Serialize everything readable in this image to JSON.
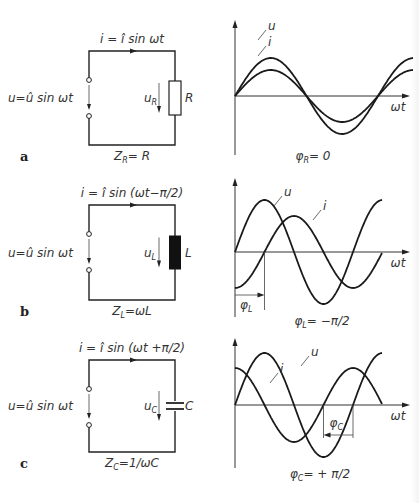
{
  "panels": [
    {
      "id": "a",
      "figure_label": "a",
      "current_eq": {
        "lhs": "i",
        "eq": " = ",
        "amp": "î",
        "rhs": " sin ωt"
      },
      "source_eq": {
        "lhs": "u",
        "eq": "=",
        "amp": "û",
        "rhs": " sin ωt"
      },
      "element_voltage": {
        "sym": "u",
        "sub": "R"
      },
      "element_name": "R",
      "element_type": "resistor",
      "impedance": {
        "sym": "Z",
        "sub": "R",
        "rhs": "= R"
      },
      "phase": {
        "sym": "φ",
        "sub": "R",
        "rhs": "= 0"
      },
      "curve_labels": {
        "u": "u",
        "i": "i"
      },
      "axis_label": "ωt"
    },
    {
      "id": "b",
      "figure_label": "b",
      "current_eq": {
        "lhs": "i",
        "eq": " = ",
        "amp": "î",
        "rhs": " sin (ωt−π/2)"
      },
      "source_eq": {
        "lhs": "u",
        "eq": "=",
        "amp": "û",
        "rhs": " sin ωt"
      },
      "element_voltage": {
        "sym": "u",
        "sub": "L"
      },
      "element_name": "L",
      "element_type": "inductor",
      "impedance": {
        "sym": "Z",
        "sub": "L",
        "rhs": "=ωL"
      },
      "phase": {
        "sym": "φ",
        "sub": "L",
        "rhs": "= −π/2"
      },
      "phase_marker": {
        "sym": "φ",
        "sub": "L"
      },
      "curve_labels": {
        "u": "u",
        "i": "i"
      },
      "axis_label": "ωt"
    },
    {
      "id": "c",
      "figure_label": "c",
      "current_eq": {
        "lhs": "i",
        "eq": " = ",
        "amp": "î",
        "rhs": " sin (ωt +π/2)"
      },
      "source_eq": {
        "lhs": "u",
        "eq": "=",
        "amp": "û",
        "rhs": " sin ωt"
      },
      "element_voltage": {
        "sym": "u",
        "sub": "C"
      },
      "element_name": "C",
      "element_type": "capacitor",
      "impedance": {
        "sym": "Z",
        "sub": "C",
        "rhs": "=1/ωC"
      },
      "phase": {
        "sym": "φ",
        "sub": "C",
        "rhs": "= + π/2"
      },
      "phase_marker": {
        "sym": "φ",
        "sub": "C"
      },
      "curve_labels": {
        "u": "u",
        "i": "i"
      },
      "axis_label": "ωt"
    }
  ],
  "chart_data": [
    {
      "type": "line",
      "title": "φR = 0",
      "xlabel": "ωt",
      "ylabel": "",
      "x_range_periods": [
        0,
        1.25
      ],
      "series": [
        {
          "name": "u",
          "amplitude": 1.0,
          "phase_deg": 0
        },
        {
          "name": "i",
          "amplitude": 0.7,
          "phase_deg": 0
        }
      ],
      "grid": false
    },
    {
      "type": "line",
      "title": "φL = −π/2",
      "xlabel": "ωt",
      "ylabel": "",
      "x_range_periods": [
        0,
        1.25
      ],
      "series": [
        {
          "name": "u",
          "amplitude": 1.0,
          "phase_deg": 0
        },
        {
          "name": "i",
          "amplitude": 0.75,
          "phase_deg": -90
        }
      ],
      "annotation": "φL arrow marks quarter-period lag of i",
      "grid": false
    },
    {
      "type": "line",
      "title": "φC = +π/2",
      "xlabel": "ωt",
      "ylabel": "",
      "x_range_periods": [
        0,
        1.25
      ],
      "series": [
        {
          "name": "u",
          "amplitude": 1.0,
          "phase_deg": 0
        },
        {
          "name": "i",
          "amplitude": 0.75,
          "phase_deg": 90
        }
      ],
      "annotation": "φC arrow marks quarter-period lead of i",
      "grid": false
    }
  ]
}
